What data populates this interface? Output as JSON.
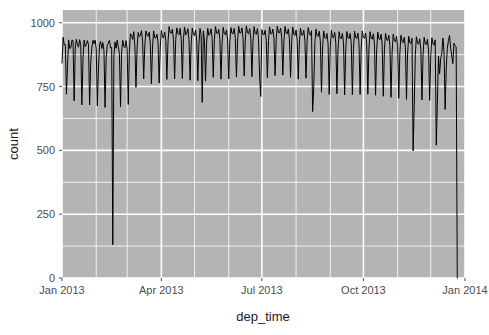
{
  "chart_data": {
    "type": "line",
    "title": "",
    "subtitle": "",
    "xlabel": "dep_time",
    "ylabel": "count",
    "grid": true,
    "legend": false,
    "legend_position": "none",
    "theme": "ggplot2-grey",
    "panel_color": "#b4b4b4",
    "gridline_color": "#ffffff",
    "line_color": "#000000",
    "line_width": 1,
    "xlim": [
      "2013-01-01",
      "2014-01-01"
    ],
    "ylim": [
      0,
      1050
    ],
    "yticks": [
      0,
      250,
      500,
      750,
      1000
    ],
    "ytick_labels": [
      "0",
      "250",
      "500",
      "750",
      "1000"
    ],
    "xticks": [
      "2013-01-01",
      "2013-04-01",
      "2013-07-01",
      "2013-10-01",
      "2014-01-01"
    ],
    "xtick_labels": [
      "Jan 2013",
      "Apr 2013",
      "Jul 2013",
      "Oct 2013",
      "Jan 2014"
    ],
    "minor_xticks": [
      "2013-02-01",
      "2013-03-01",
      "2013-05-01",
      "2013-06-01",
      "2013-08-01",
      "2013-09-01",
      "2013-11-01",
      "2013-12-01"
    ],
    "minor_yticks": [
      125,
      375,
      625,
      875
    ],
    "x_start_index": 0,
    "n_points": 365,
    "values": [
      842,
      943,
      914,
      915,
      720,
      832,
      933,
      899,
      902,
      932,
      930,
      694,
      900,
      935,
      915,
      904,
      934,
      912,
      678,
      856,
      932,
      906,
      915,
      930,
      914,
      678,
      843,
      900,
      931,
      918,
      932,
      898,
      674,
      815,
      916,
      927,
      899,
      922,
      892,
      668,
      863,
      912,
      920,
      931,
      901,
      903,
      130,
      867,
      925,
      900,
      932,
      906,
      880,
      671,
      886,
      931,
      907,
      902,
      930,
      898,
      680,
      884,
      957,
      951,
      935,
      965,
      908,
      747,
      902,
      962,
      945,
      950,
      969,
      928,
      780,
      911,
      968,
      950,
      947,
      963,
      916,
      761,
      905,
      968,
      941,
      940,
      955,
      923,
      764,
      905,
      970,
      944,
      941,
      963,
      930,
      778,
      924,
      985,
      961,
      959,
      975,
      932,
      780,
      935,
      980,
      958,
      953,
      978,
      936,
      781,
      939,
      983,
      952,
      959,
      977,
      934,
      775,
      918,
      979,
      955,
      950,
      971,
      932,
      773,
      914,
      978,
      953,
      688,
      968,
      930,
      771,
      924,
      979,
      951,
      956,
      976,
      938,
      786,
      933,
      985,
      960,
      957,
      974,
      934,
      779,
      922,
      982,
      957,
      953,
      972,
      932,
      780,
      928,
      981,
      958,
      957,
      978,
      938,
      787,
      929,
      986,
      960,
      960,
      980,
      940,
      792,
      932,
      988,
      961,
      957,
      977,
      938,
      789,
      930,
      985,
      957,
      955,
      977,
      936,
      786,
      711,
      973,
      955,
      953,
      971,
      930,
      785,
      930,
      984,
      958,
      956,
      975,
      937,
      793,
      934,
      987,
      962,
      960,
      979,
      940,
      795,
      931,
      986,
      959,
      957,
      976,
      936,
      786,
      927,
      983,
      955,
      950,
      972,
      930,
      779,
      925,
      979,
      953,
      951,
      971,
      931,
      783,
      929,
      981,
      958,
      951,
      969,
      652,
      744,
      918,
      975,
      949,
      947,
      967,
      925,
      728,
      901,
      968,
      942,
      938,
      958,
      918,
      719,
      906,
      971,
      944,
      941,
      962,
      920,
      722,
      898,
      965,
      939,
      938,
      959,
      917,
      717,
      899,
      966,
      941,
      938,
      958,
      918,
      718,
      900,
      967,
      942,
      938,
      959,
      918,
      719,
      901,
      968,
      943,
      939,
      960,
      919,
      720,
      898,
      965,
      940,
      936,
      957,
      916,
      716,
      894,
      963,
      938,
      934,
      955,
      914,
      712,
      890,
      959,
      934,
      930,
      951,
      910,
      708,
      886,
      955,
      930,
      926,
      947,
      906,
      704,
      882,
      951,
      926,
      922,
      943,
      902,
      700,
      878,
      947,
      922,
      918,
      939,
      498,
      672,
      876,
      945,
      920,
      916,
      937,
      896,
      698,
      874,
      943,
      918,
      914,
      935,
      894,
      696,
      872,
      941,
      916,
      912,
      933,
      520,
      690,
      870,
      800,
      860,
      880,
      940,
      888,
      660,
      820,
      900,
      930,
      950,
      900,
      870,
      840,
      920,
      910,
      905,
      0
    ]
  },
  "axis": {
    "ylabel": "count",
    "xlabel": "dep_time"
  }
}
